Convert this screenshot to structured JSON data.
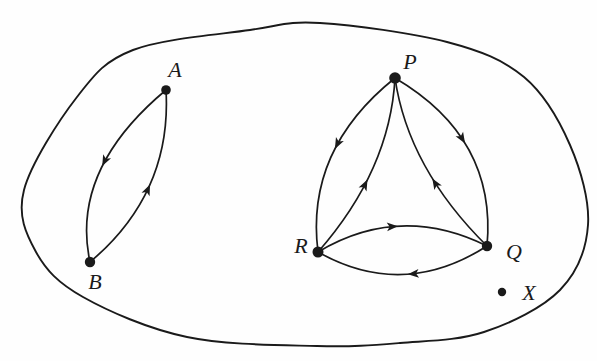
{
  "figure": {
    "background": "#fefefe",
    "ink_color": "#1a1a1a",
    "boundary": {
      "stroke_width": 1.9,
      "points": [
        [
          24,
          190
        ],
        [
          77,
          97
        ],
        [
          133,
          50
        ],
        [
          250,
          30
        ],
        [
          320,
          23
        ],
        [
          447,
          42
        ],
        [
          524,
          77
        ],
        [
          570,
          145
        ],
        [
          588,
          225
        ],
        [
          560,
          290
        ],
        [
          484,
          332
        ],
        [
          400,
          343
        ],
        [
          317,
          346
        ],
        [
          187,
          337
        ],
        [
          83,
          297
        ],
        [
          36,
          252
        ]
      ]
    },
    "nodes": [
      {
        "id": "A",
        "label": "A",
        "x": 166,
        "y": 90,
        "r": 4.8,
        "label_x": 175,
        "label_y": 69
      },
      {
        "id": "B",
        "label": "B",
        "x": 90,
        "y": 262,
        "r": 5.2,
        "label_x": 95,
        "label_y": 281
      },
      {
        "id": "P",
        "label": "P",
        "x": 395,
        "y": 78,
        "r": 5.8,
        "label_x": 410,
        "label_y": 61
      },
      {
        "id": "R",
        "label": "R",
        "x": 318,
        "y": 252,
        "r": 5.5,
        "label_x": 301,
        "label_y": 245
      },
      {
        "id": "Q",
        "label": "Q",
        "x": 487,
        "y": 246,
        "r": 5.2,
        "label_x": 514,
        "label_y": 251
      },
      {
        "id": "X",
        "label": "X",
        "x": 502,
        "y": 292,
        "r": 4.2,
        "label_x": 529,
        "label_y": 292
      }
    ],
    "edges": [
      {
        "from": "A",
        "to": "B",
        "control": [
          70,
          170
        ],
        "arrow_t": 0.46
      },
      {
        "from": "B",
        "to": "A",
        "control": [
          172,
          193
        ],
        "arrow_t": 0.5
      },
      {
        "from": "P",
        "to": "R",
        "control": [
          305,
          150
        ],
        "arrow_t": 0.45
      },
      {
        "from": "R",
        "to": "P",
        "control": [
          390,
          170
        ],
        "arrow_t": 0.43
      },
      {
        "from": "P",
        "to": "Q",
        "control": [
          497,
          138
        ],
        "arrow_t": 0.46
      },
      {
        "from": "Q",
        "to": "P",
        "control": [
          408,
          168
        ],
        "arrow_t": 0.42
      },
      {
        "from": "R",
        "to": "Q",
        "control": [
          400,
          203
        ],
        "arrow_t": 0.48
      },
      {
        "from": "Q",
        "to": "R",
        "control": [
          403,
          300
        ],
        "arrow_t": 0.47
      }
    ],
    "edge_stroke_width": 1.7,
    "arrow": {
      "length": 11,
      "half_width": 4.4,
      "notch": 8.3
    }
  }
}
